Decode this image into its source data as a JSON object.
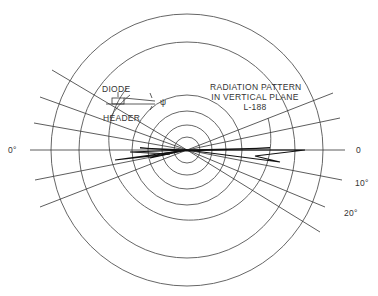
{
  "diagram": {
    "title_lines": [
      "RADIATION PATTERN",
      "IN VERTICAL PLANE",
      "L-188"
    ],
    "inset_labels": {
      "diode": "DIODE",
      "header": "HEADER",
      "angle_symbol": "ψ"
    },
    "angle_labels": {
      "left_zero": "0°",
      "right_zero": "0",
      "ten": "10°",
      "twenty": "20°"
    },
    "center": [
      187,
      150
    ],
    "ring_radii": [
      13,
      25,
      39,
      55,
      81,
      108,
      136
    ],
    "radial_line_angles_deg": [
      -20,
      -10,
      0,
      10,
      20,
      30
    ],
    "colors": {
      "ink": "#222222",
      "ring": "#555555",
      "background": "#ffffff"
    }
  }
}
